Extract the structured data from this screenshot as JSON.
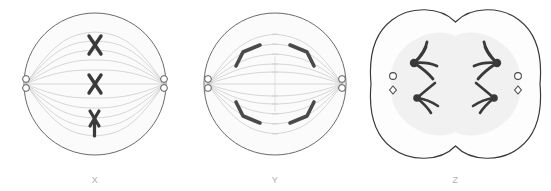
{
  "figure": {
    "background_color": "#ffffff",
    "panels": [
      {
        "id": "x",
        "label": "X",
        "stage": "metaphase",
        "cell_shape": "circle",
        "description": "Chromosomes aligned at the cell equator with spindle fibers extending from two opposite centrosomes",
        "chromosome_count": 3,
        "chromosome_shape": "x-shaped",
        "centrosome_count": 2,
        "has_cleavage_furrow": false,
        "membrane_color": "#6b6b6b",
        "cytoplasm_color": "#fbfbfb",
        "chromosome_color": "#3a3a3a",
        "spindle_color": "#b9b9b9"
      },
      {
        "id": "y",
        "label": "Y",
        "stage": "anaphase",
        "cell_shape": "circle",
        "description": "Sister chromatids separated and moving as V-shapes toward opposite poles",
        "chromosome_count": 4,
        "chromosome_shape": "chevron",
        "centrosome_count": 2,
        "has_cleavage_furrow": false,
        "membrane_color": "#6b6b6b",
        "cytoplasm_color": "#fbfbfb",
        "chromosome_color": "#4a4a4a",
        "spindle_color": "#b9b9b9"
      },
      {
        "id": "z",
        "label": "Z",
        "stage": "telophase-cytokinesis",
        "cell_shape": "pinched",
        "description": "Cell pinching inward at a cleavage furrow with decondensing chromosome clusters at each pole",
        "chromosome_count": 4,
        "chromosome_shape": "fanned-cluster",
        "centrosome_count": 2,
        "has_cleavage_furrow": true,
        "membrane_color": "#3a3a3a",
        "cytoplasm_color": "#fdfdfd",
        "inner_region_color": "#f1f1f1",
        "chromosome_color": "#3a3a3a",
        "spindle_color": "#b9b9b9"
      }
    ]
  }
}
